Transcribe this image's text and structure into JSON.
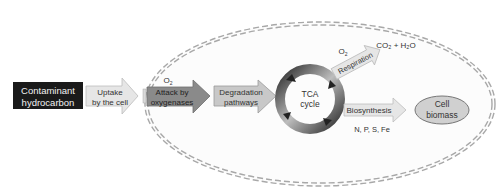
{
  "diagram": {
    "source_node": {
      "line1": "Contaminant",
      "line2": "hydrocarbon"
    },
    "uptake": {
      "line1": "Uptake",
      "line2": "by the cell"
    },
    "attack": {
      "line1": "Attack by",
      "line2": "oxygenases",
      "input": "O",
      "input_sub": "2"
    },
    "degradation": {
      "line1": "Degradation",
      "line2": "pathways"
    },
    "tca": {
      "line1": "TCA",
      "line2": "cycle"
    },
    "respiration": {
      "label": "Respiration",
      "input": "O",
      "input_sub": "2",
      "output": "CO₂ + H₂O"
    },
    "biosynthesis": {
      "label": "Biosynthesis",
      "nutrients": "N, P, S, Fe"
    },
    "biomass": {
      "line1": "Cell",
      "line2": "biomass"
    }
  },
  "colors": {
    "source_fill": "#1a1a1a",
    "uptake_fill": "#e8e8e8",
    "attack_fill": "#8a8a8a",
    "degradation_fill": "#c4c4c4",
    "cell_border": "#aaaaaa",
    "biomass_fill": "#d0d0d0"
  }
}
